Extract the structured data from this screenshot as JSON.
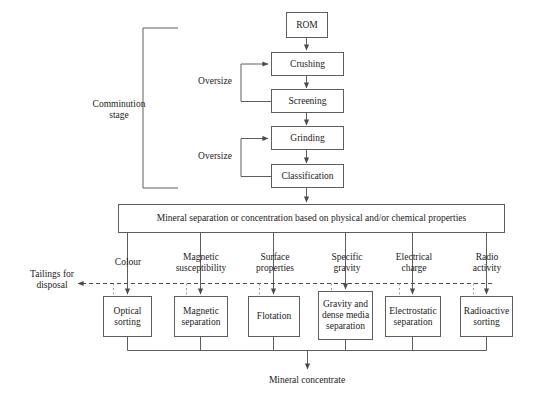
{
  "diagram": {
    "stage_label": "Comminution\nstage",
    "feedback_label_1": "Oversize",
    "feedback_label_2": "Oversize",
    "tailings_label": "Tailings for\ndisposal",
    "output_label": "Mineral concentrate",
    "separation_bar": "Mineral separation or concentration based on physical and/or chemical properties",
    "comminution_boxes": [
      {
        "id": "rom",
        "label": "ROM"
      },
      {
        "id": "crushing",
        "label": "Crushing"
      },
      {
        "id": "screening",
        "label": "Screening"
      },
      {
        "id": "grinding",
        "label": "Grinding"
      },
      {
        "id": "classification",
        "label": "Classification"
      }
    ],
    "property_labels": [
      {
        "id": "colour",
        "label": "Colour"
      },
      {
        "id": "magnetic-susceptibility",
        "label": "Magnetic\nsusceptibility"
      },
      {
        "id": "surface-properties",
        "label": "Surface\nproperties"
      },
      {
        "id": "specific-gravity",
        "label": "Specific\ngravity"
      },
      {
        "id": "electrical-charge",
        "label": "Electrical\ncharge"
      },
      {
        "id": "radio-activity",
        "label": "Radio\nactivity"
      }
    ],
    "separation_boxes": [
      {
        "id": "optical-sorting",
        "label": "Optical\nsorting"
      },
      {
        "id": "magnetic-separation",
        "label": "Magnetic\nseparation"
      },
      {
        "id": "flotation",
        "label": "Flotation"
      },
      {
        "id": "gravity-dense-media",
        "label": "Gravity and\ndense\nmedia\nseparation"
      },
      {
        "id": "electrostatic-separation",
        "label": "Electrostatic\nseparation"
      },
      {
        "id": "radioactive-sorting",
        "label": "Radioactive\nsorting"
      }
    ],
    "colors": {
      "line": "#5e5e5e",
      "text": "#1b1b1b",
      "background": "#ffffff",
      "dashed": "#4a4a4a"
    }
  }
}
